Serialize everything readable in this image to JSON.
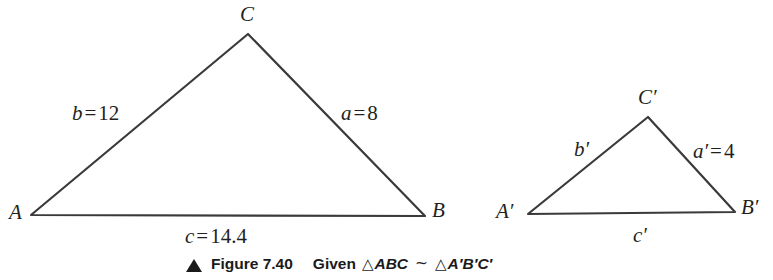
{
  "figure": {
    "background_color": "#ffffff",
    "stroke_color": "#3a3a3a",
    "text_color": "#231f20",
    "large_triangle": {
      "name": "triangle-ABC",
      "vertices": {
        "A": {
          "label": "A",
          "x": 31,
          "y": 215
        },
        "B": {
          "label": "B",
          "x": 425,
          "y": 216
        },
        "C": {
          "label": "C",
          "x": 248,
          "y": 34
        }
      },
      "vertex_labels": [
        {
          "name": "vertex-label-A",
          "text": "A",
          "x": 9,
          "y": 206
        },
        {
          "name": "vertex-label-B",
          "text": "B",
          "x": 432,
          "y": 204
        },
        {
          "name": "vertex-label-C",
          "text": "C",
          "x": 240,
          "y": 6
        }
      ],
      "side_labels": [
        {
          "name": "side-label-b",
          "var": "b",
          "eq": "=",
          "value": "12",
          "x": 72,
          "y": 103
        },
        {
          "name": "side-label-a",
          "var": "a",
          "eq": "=",
          "value": "8",
          "x": 341,
          "y": 103
        },
        {
          "name": "side-label-c",
          "var": "c",
          "eq": "=",
          "value": "14.4",
          "x": 185,
          "y": 226
        }
      ]
    },
    "small_triangle": {
      "name": "triangle-A-prime-B-prime-C-prime",
      "vertices": {
        "A'": {
          "label": "A'",
          "x": 528,
          "y": 214
        },
        "B'": {
          "label": "B'",
          "x": 735,
          "y": 212
        },
        "C'": {
          "label": "C'",
          "x": 648,
          "y": 117
        }
      },
      "vertex_labels": [
        {
          "name": "vertex-label-A-prime",
          "text": "A",
          "prime": "′",
          "x": 496,
          "y": 205
        },
        {
          "name": "vertex-label-B-prime",
          "text": "B",
          "prime": "′",
          "x": 741,
          "y": 201
        },
        {
          "name": "vertex-label-C-prime",
          "text": "C",
          "prime": "′",
          "x": 638,
          "y": 89
        }
      ],
      "side_labels": [
        {
          "name": "side-label-b-prime",
          "var": "b",
          "prime": "′",
          "eq": "",
          "value": "",
          "x": 574,
          "y": 139
        },
        {
          "name": "side-label-a-prime",
          "var": "a",
          "prime": "′",
          "eq": "=",
          "value": "4",
          "x": 693,
          "y": 141
        },
        {
          "name": "side-label-c-prime",
          "var": "c",
          "prime": "′",
          "eq": "",
          "value": "",
          "x": 633,
          "y": 225
        }
      ]
    }
  },
  "caption": {
    "marker": "triangle-up-marker",
    "figure_number": "Figure 7.40",
    "given_word": "Given",
    "delta": "△",
    "triangle_1": "ABC",
    "similar_symbol": "~",
    "triangle_2": "A′B′C′",
    "full_text": "▲ Figure 7.40  Given △ABC ~ △A′B′C′"
  }
}
